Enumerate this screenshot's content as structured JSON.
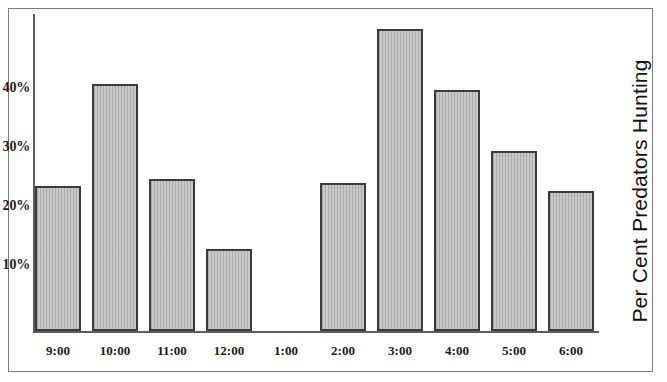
{
  "chart_data": {
    "type": "bar",
    "title": "",
    "xlabel": "",
    "ylabel": "Per Cent Predators Hunting",
    "categories": [
      "9:00",
      "10:00",
      "11:00",
      "12:00",
      "1:00",
      "2:00",
      "3:00",
      "4:00",
      "5:00",
      "6:00"
    ],
    "values": [
      23.8,
      40.5,
      25.0,
      13.5,
      0,
      24.3,
      49.5,
      39.5,
      29.5,
      23.0
    ],
    "ylim": [
      0,
      52
    ],
    "yticks": [
      10,
      20,
      30,
      40
    ],
    "ytick_labels": [
      "10%",
      "20%",
      "30%",
      "40%"
    ],
    "grid": false,
    "legend": null,
    "bar_fill_color": "#c9c9c9",
    "bar_border_color": "#3b3b3b",
    "axis_color": "#5e5e5e",
    "frame_color": "#7a7a7a",
    "text_color": "#1a1a1a"
  }
}
